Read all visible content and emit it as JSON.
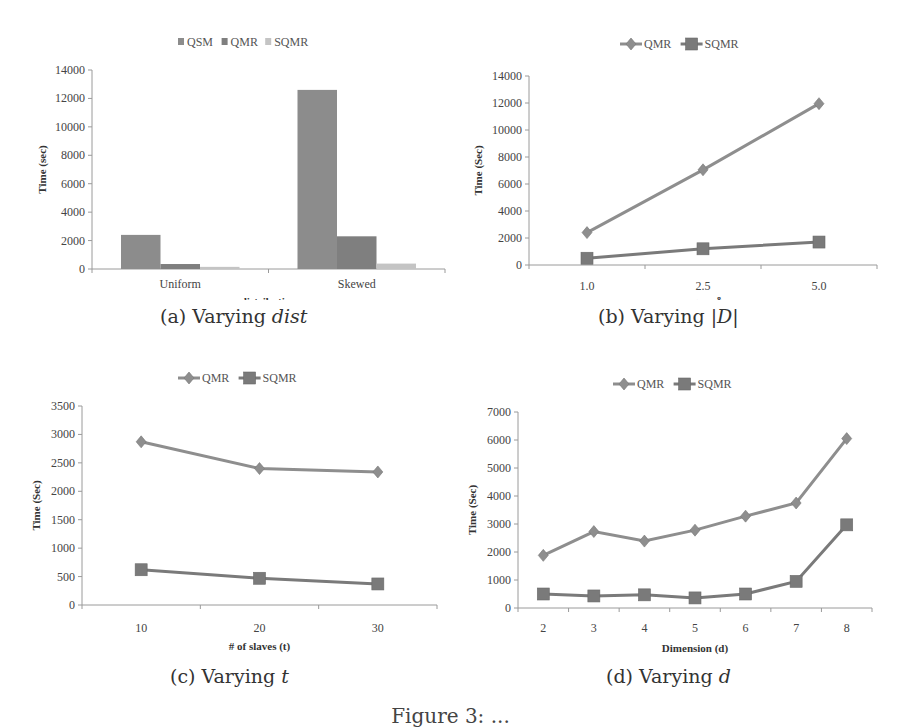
{
  "figure": {
    "caption": "Figure 3: ..."
  },
  "panels": [
    {
      "id": "a",
      "caption_prefix": "(a) Varying ",
      "caption_var": "dist"
    },
    {
      "id": "b",
      "caption_prefix": "(b) Varying ",
      "caption_var": "|D|"
    },
    {
      "id": "c",
      "caption_prefix": "(c) Varying ",
      "caption_var": "t"
    },
    {
      "id": "d",
      "caption_prefix": "(d) Varying ",
      "caption_var": "d"
    }
  ],
  "colors": {
    "QSM": "#8c8c8c",
    "QMR": "#7f7f7f",
    "SQMR": "#c4c4c4",
    "line_QMR": "#8e8e8e",
    "line_SQMR": "#7a7a7a",
    "axis": "#9a9a9a"
  },
  "chart_data": [
    {
      "id": "a",
      "type": "bar",
      "title": "",
      "xlabel": "distribution",
      "ylabel": "Time (sec)",
      "categories": [
        "Uniform",
        "Skewed"
      ],
      "series": [
        {
          "name": "QSM",
          "values": [
            2400,
            12600
          ]
        },
        {
          "name": "QMR",
          "values": [
            350,
            2300
          ]
        },
        {
          "name": "SQMR",
          "values": [
            150,
            380
          ]
        }
      ],
      "ylim": [
        0,
        14000
      ],
      "yticks": [
        0,
        2000,
        4000,
        6000,
        8000,
        10000,
        12000,
        14000
      ],
      "grid": false,
      "legend_position": "top"
    },
    {
      "id": "b",
      "type": "line",
      "title": "",
      "xlabel": "|D|(x 10^8)",
      "ylabel": "Time (Sec)",
      "categories": [
        "1.0",
        "2.5",
        "5.0"
      ],
      "series": [
        {
          "name": "QMR",
          "marker": "diamond",
          "values": [
            2400,
            7050,
            11950
          ]
        },
        {
          "name": "SQMR",
          "marker": "square",
          "values": [
            500,
            1200,
            1700
          ]
        }
      ],
      "ylim": [
        0,
        14000
      ],
      "yticks": [
        0,
        2000,
        4000,
        6000,
        8000,
        10000,
        12000,
        14000
      ],
      "grid": false,
      "legend_position": "top"
    },
    {
      "id": "c",
      "type": "line",
      "title": "",
      "xlabel": "# of slaves (t)",
      "ylabel": "Time (Sec)",
      "categories": [
        "10",
        "20",
        "30"
      ],
      "series": [
        {
          "name": "QMR",
          "marker": "diamond",
          "values": [
            2870,
            2400,
            2340
          ]
        },
        {
          "name": "SQMR",
          "marker": "square",
          "values": [
            620,
            470,
            370
          ]
        }
      ],
      "ylim": [
        0,
        3500
      ],
      "yticks": [
        0,
        500,
        1000,
        1500,
        2000,
        2500,
        3000,
        3500
      ],
      "grid": false,
      "legend_position": "top"
    },
    {
      "id": "d",
      "type": "line",
      "title": "",
      "xlabel": "Dimension (d)",
      "ylabel": "Time (Sec)",
      "categories": [
        "2",
        "3",
        "4",
        "5",
        "6",
        "7",
        "8"
      ],
      "series": [
        {
          "name": "QMR",
          "marker": "diamond",
          "values": [
            1880,
            2730,
            2390,
            2780,
            3280,
            3750,
            6050
          ]
        },
        {
          "name": "SQMR",
          "marker": "square",
          "values": [
            500,
            430,
            470,
            360,
            500,
            950,
            2970
          ]
        }
      ],
      "ylim": [
        0,
        7000
      ],
      "yticks": [
        0,
        1000,
        2000,
        3000,
        4000,
        5000,
        6000,
        7000
      ],
      "grid": false,
      "legend_position": "top"
    }
  ]
}
